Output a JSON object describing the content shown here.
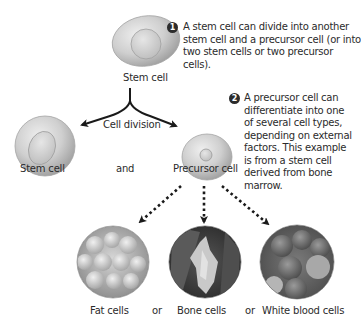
{
  "diagram": {
    "top_cell": {
      "label": "Stem cell"
    },
    "division": {
      "label": "Cell division"
    },
    "daughters": [
      {
        "label": "Stem cell"
      },
      {
        "label": "and"
      },
      {
        "label": "Precursor cell"
      }
    ],
    "notes": [
      {
        "number": "1",
        "text": "A stem cell can divide into another stem cell and a precursor cell (or into two stem cells or two precursor cells)."
      },
      {
        "number": "2",
        "text": "A precursor cell can differentiate into one of several cell types, depending on external factors. This example is from a stem cell derived from bone marrow."
      }
    ],
    "differentiated": [
      {
        "label": "Fat cells"
      },
      {
        "label": "Bone cells"
      },
      {
        "label": "White blood cells"
      }
    ],
    "connectors": [
      "or",
      "or"
    ]
  },
  "colors": {
    "cell_fill": "#c8c8c8",
    "cell_edge": "#9a9a9a",
    "arrow": "#1a1a1a",
    "badge": "#2c2c2c"
  }
}
